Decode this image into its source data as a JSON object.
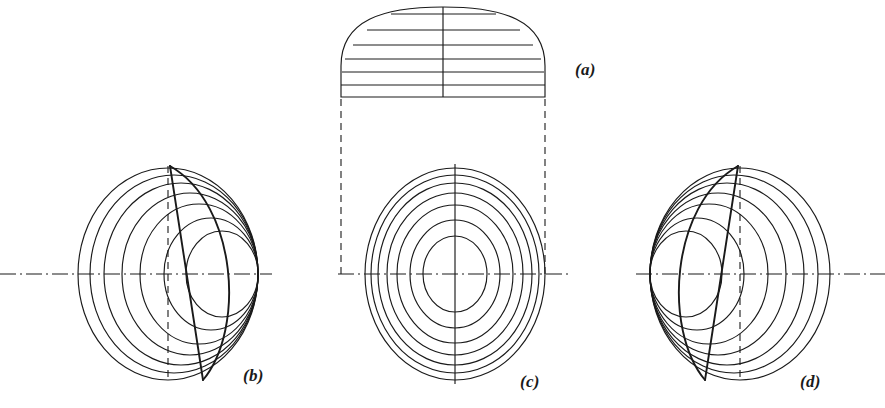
{
  "plate": {
    "width": 885,
    "height": 408,
    "background_color": "#ffffff",
    "ink_color": "#1a1a1a"
  },
  "labels": {
    "a": "(a)",
    "b": "(b)",
    "c": "(c)",
    "d": "(d)"
  },
  "figures": {
    "a": {
      "name": "dome-elevation",
      "center_x": 443,
      "base_y": 97,
      "half_width": 102,
      "height": 92,
      "vertical_centerline": true,
      "cutting_plane_count": 6,
      "cutting_plane_y": [
        14,
        30,
        45,
        59,
        72,
        85,
        97
      ],
      "description": "Hemispherical dome elevation with horizontal cutting planes"
    },
    "b": {
      "name": "plan-view-eccentric-right",
      "center_x": 168,
      "center_y": 274,
      "outer_radius_x": 90,
      "outer_radius_y": 106,
      "ring_count": 7,
      "bunching_side": "right",
      "leaf_apex_top_y": 166,
      "leaf_apex_bottom_y": 380,
      "leaf_bulge": "right",
      "vertical_centerline_style": "dashed",
      "horizontal_centerline_style": "dash-dot"
    },
    "c": {
      "name": "plan-view-concentric",
      "center_x": 455,
      "center_y": 274,
      "outer_radius_x": 90,
      "outer_radius_y": 106,
      "ring_count": 7,
      "bunching_side": "none",
      "vertical_centerline_style": "solid",
      "horizontal_centerline_style": "dash-dot"
    },
    "d": {
      "name": "plan-view-eccentric-left",
      "center_x": 740,
      "center_y": 274,
      "outer_radius_x": 90,
      "outer_radius_y": 106,
      "ring_count": 7,
      "bunching_side": "left",
      "leaf_apex_top_y": 166,
      "leaf_apex_bottom_y": 380,
      "leaf_bulge": "left",
      "vertical_centerline_style": "dashed",
      "horizontal_centerline_style": "dash-dot"
    }
  },
  "projection_lines": {
    "name": "dome-to-plan-projectors",
    "style": "dashed",
    "left_x": 341,
    "right_x": 545,
    "top_y": 97,
    "bottom_y": 274
  }
}
